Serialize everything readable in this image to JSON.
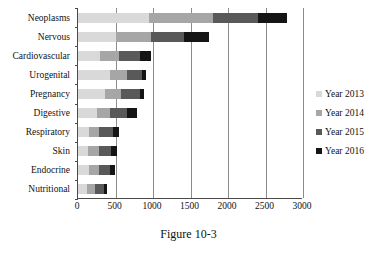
{
  "caption": "Figure 10-3",
  "legend": {
    "position": "right",
    "items": [
      {
        "label": "Year 2013",
        "color": "#d9d9d9",
        "swatch_name": "legend-swatch-year-2013"
      },
      {
        "label": "Year 2014",
        "color": "#a6a6a6",
        "swatch_name": "legend-swatch-year-2014"
      },
      {
        "label": "Year 2015",
        "color": "#595959",
        "swatch_name": "legend-swatch-year-2015"
      },
      {
        "label": "Year 2016",
        "color": "#151515",
        "swatch_name": "legend-swatch-year-2016"
      }
    ]
  },
  "axis": {
    "x_ticks": [
      "0",
      "500",
      "1000",
      "1500",
      "2000",
      "2500",
      "3000"
    ],
    "x_min": 0,
    "x_max": 3000,
    "x_step": 500
  },
  "chart_data": {
    "type": "bar",
    "orientation": "horizontal",
    "stacked": true,
    "title": "",
    "subtitle": "",
    "xlabel": "",
    "ylabel": "",
    "xlim": [
      0,
      3000
    ],
    "xticks": [
      0,
      500,
      1000,
      1500,
      2000,
      2500,
      3000
    ],
    "grid": "vertical",
    "legend_position": "right",
    "categories": [
      "Neoplasms",
      "Nervous",
      "Cardiovascular",
      "Urogenital",
      "Pregnancy",
      "Digestive",
      "Respiratory",
      "Skin",
      "Endocrine",
      "Nutritional"
    ],
    "series": [
      {
        "name": "Year 2013",
        "color": "#d9d9d9",
        "values": [
          950,
          500,
          290,
          420,
          360,
          250,
          150,
          130,
          150,
          120
        ]
      },
      {
        "name": "Year 2014",
        "color": "#a6a6a6",
        "values": [
          850,
          470,
          250,
          230,
          210,
          170,
          130,
          150,
          130,
          100
        ]
      },
      {
        "name": "Year 2015",
        "color": "#595959",
        "values": [
          600,
          440,
          280,
          200,
          250,
          230,
          190,
          160,
          140,
          130
        ]
      },
      {
        "name": "Year 2016",
        "color": "#151515",
        "values": [
          380,
          340,
          150,
          60,
          65,
          130,
          80,
          75,
          70,
          35
        ]
      }
    ],
    "totals": [
      2780,
      1750,
      970,
      910,
      885,
      780,
      550,
      515,
      490,
      385
    ]
  }
}
